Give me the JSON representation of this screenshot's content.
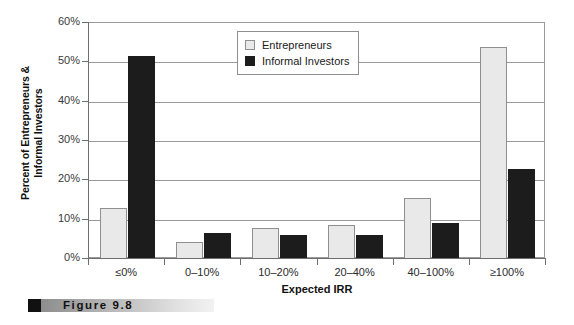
{
  "chart_data": {
    "type": "bar",
    "title": "",
    "xlabel": "Expected IRR",
    "ylabel": "Percent of Entrepreneurs & Informal Investors",
    "ylabel_lines": [
      "Percent of Entrepreneurs &",
      "Informal Investors"
    ],
    "categories": [
      "≤0%",
      "0–10%",
      "10–20%",
      "20–40%",
      "40–100%",
      "≥100%"
    ],
    "series": [
      {
        "name": "Entrepreneurs",
        "color": "#e9e9e9",
        "values": [
          12.9,
          4.3,
          7.8,
          8.7,
          15.5,
          54.0
        ]
      },
      {
        "name": "Informal Investors",
        "color": "#1c1c1c",
        "values": [
          51.5,
          6.7,
          6.2,
          6.1,
          9.2,
          23.0
        ]
      }
    ],
    "ylim": [
      0,
      60
    ],
    "ytick_labels": [
      "0%",
      "10%",
      "20%",
      "30%",
      "40%",
      "50%",
      "60%"
    ],
    "ytick_values": [
      0,
      10,
      20,
      30,
      40,
      50,
      60
    ],
    "grid": true,
    "legend_position": "top-center"
  },
  "legend": {
    "items": [
      {
        "label": "Entrepreneurs",
        "swatch": "light"
      },
      {
        "label": "Informal Investors",
        "swatch": "dark"
      }
    ]
  },
  "caption": {
    "text": "Figure  9.8"
  }
}
